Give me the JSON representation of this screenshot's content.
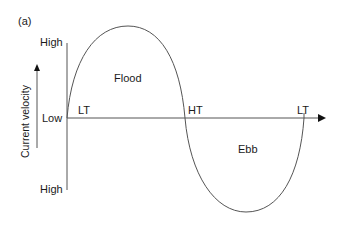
{
  "panel_label": "(a)",
  "y_axis": {
    "title": "Current velocity",
    "tick_top": "High",
    "tick_mid": "Low",
    "tick_bottom": "High"
  },
  "x_axis": {
    "markers": [
      "LT",
      "HT",
      "LT"
    ]
  },
  "regions": {
    "upper": "Flood",
    "lower": "Ebb"
  },
  "colors": {
    "line": "#555555",
    "text": "#1a1a1a",
    "background": "#ffffff"
  }
}
